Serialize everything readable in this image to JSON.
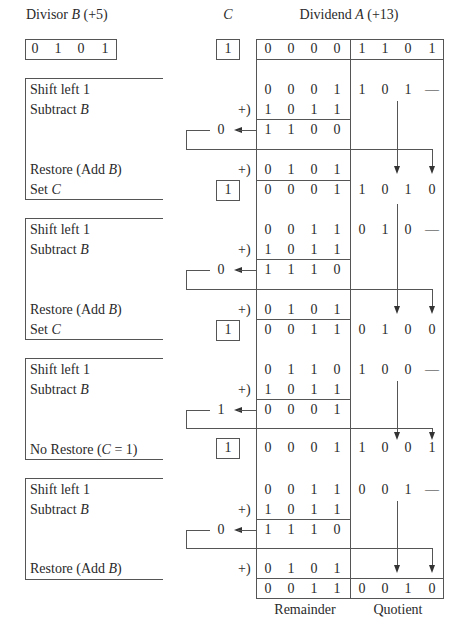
{
  "header": {
    "divisor_label_prefix": "Divisor ",
    "divisor_label_var": "B",
    "divisor_label_suffix": " (+5)",
    "divisor_bits": [
      "0",
      "1",
      "0",
      "1"
    ],
    "c_label": "C",
    "c_initial": "1",
    "dividend_label_prefix": "Dividend ",
    "dividend_label_var": "A",
    "dividend_label_suffix": " (+13)",
    "dividend_remainder_bits": [
      "0",
      "0",
      "0",
      "0"
    ],
    "dividend_quotient_bits": [
      "1",
      "1",
      "0",
      "1"
    ]
  },
  "steps": [
    {
      "shift_label": "Shift left 1",
      "subtract_label_prefix": "Subtract ",
      "subtract_label_var": "B",
      "shift_remainder": [
        "0",
        "0",
        "0",
        "1"
      ],
      "shift_quotient": [
        "1",
        "0",
        "1",
        "—"
      ],
      "plus_sign": "+)",
      "neg_b": [
        "1",
        "0",
        "1",
        "1"
      ],
      "sub_result": [
        "1",
        "1",
        "0",
        "0"
      ],
      "carry_out": "0",
      "restore_label_prefix": "Restore (Add ",
      "restore_label_var": "B",
      "restore_label_suffix": ")",
      "restore_plus": "+)",
      "restore_b": [
        "0",
        "1",
        "0",
        "1"
      ],
      "setc_label_prefix": "Set ",
      "setc_label_var": "C",
      "c_value": "1",
      "final_remainder": [
        "0",
        "0",
        "0",
        "1"
      ],
      "final_quotient": [
        "1",
        "0",
        "1",
        "0"
      ]
    },
    {
      "shift_label": "Shift left 1",
      "subtract_label_prefix": "Subtract ",
      "subtract_label_var": "B",
      "shift_remainder": [
        "0",
        "0",
        "1",
        "1"
      ],
      "shift_quotient": [
        "0",
        "1",
        "0",
        "—"
      ],
      "plus_sign": "+)",
      "neg_b": [
        "1",
        "0",
        "1",
        "1"
      ],
      "sub_result": [
        "1",
        "1",
        "1",
        "0"
      ],
      "carry_out": "0",
      "restore_label_prefix": "Restore (Add ",
      "restore_label_var": "B",
      "restore_label_suffix": ")",
      "restore_plus": "+)",
      "restore_b": [
        "0",
        "1",
        "0",
        "1"
      ],
      "setc_label_prefix": "Set ",
      "setc_label_var": "C",
      "c_value": "1",
      "final_remainder": [
        "0",
        "0",
        "1",
        "1"
      ],
      "final_quotient": [
        "0",
        "1",
        "0",
        "0"
      ]
    },
    {
      "shift_label": "Shift left 1",
      "subtract_label_prefix": "Subtract ",
      "subtract_label_var": "B",
      "shift_remainder": [
        "0",
        "1",
        "1",
        "0"
      ],
      "shift_quotient": [
        "1",
        "0",
        "0",
        "—"
      ],
      "plus_sign": "+)",
      "neg_b": [
        "1",
        "0",
        "1",
        "1"
      ],
      "sub_result": [
        "0",
        "0",
        "0",
        "1"
      ],
      "carry_out": "1",
      "norestore_label_prefix": "No Restore (",
      "norestore_label_var": "C",
      "norestore_label_suffix": " = 1)",
      "c_value": "1",
      "final_remainder": [
        "0",
        "0",
        "0",
        "1"
      ],
      "final_quotient": [
        "1",
        "0",
        "0",
        "1"
      ]
    },
    {
      "shift_label": "Shift left 1",
      "subtract_label_prefix": "Subtract ",
      "subtract_label_var": "B",
      "shift_remainder": [
        "0",
        "0",
        "1",
        "1"
      ],
      "shift_quotient": [
        "0",
        "0",
        "1",
        "—"
      ],
      "plus_sign": "+)",
      "neg_b": [
        "1",
        "0",
        "1",
        "1"
      ],
      "sub_result": [
        "1",
        "1",
        "1",
        "0"
      ],
      "carry_out": "0",
      "restore_label_prefix": "Restore (Add ",
      "restore_label_var": "B",
      "restore_label_suffix": ")",
      "restore_plus": "+)",
      "restore_b": [
        "0",
        "1",
        "0",
        "1"
      ],
      "final_remainder": [
        "0",
        "0",
        "1",
        "1"
      ],
      "final_quotient": [
        "0",
        "0",
        "1",
        "0"
      ]
    }
  ],
  "footer": {
    "remainder_label": "Remainder",
    "quotient_label": "Quotient"
  }
}
